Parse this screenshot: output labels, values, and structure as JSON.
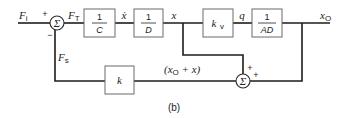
{
  "diagram": {
    "caption": "(b)",
    "signals": {
      "input_F": "F",
      "input_sub": "i",
      "Ft_F": "F",
      "Ft_sub": "T",
      "Fs_F": "F",
      "Fs_sub": "s",
      "xdot": "ẋ",
      "x": "x",
      "q": "q",
      "output_x": "x",
      "output_sub": "O",
      "feedback_sum_open": "(x",
      "feedback_sum_sub": "O",
      "feedback_sum_rest": " + x)"
    },
    "summing_junctions": [
      {
        "id": "sum1",
        "symbol": "Σ",
        "signs": [
          "+",
          "−"
        ]
      },
      {
        "id": "sum2",
        "symbol": "Σ",
        "signs": [
          "+",
          "+"
        ]
      }
    ],
    "blocks": [
      {
        "id": "one-over-c",
        "numerator": "1",
        "denominator": "C"
      },
      {
        "id": "one-over-d",
        "numerator": "1",
        "denominator": "D"
      },
      {
        "id": "kv",
        "label": "k",
        "label_sub": "v"
      },
      {
        "id": "one-over-ad",
        "numerator": "1",
        "denominator": "AD"
      },
      {
        "id": "k",
        "label": "k"
      }
    ]
  }
}
